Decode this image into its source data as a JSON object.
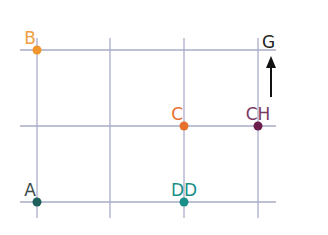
{
  "diagram": {
    "points": [
      {
        "label": "B",
        "col": 0,
        "row": 0,
        "color": "#f0962e"
      },
      {
        "label": "C",
        "col": 2,
        "row": 1,
        "color": "#e8702e"
      },
      {
        "label": "CH",
        "col": 3,
        "row": 1,
        "color": "#6b1d4e"
      },
      {
        "label": "A",
        "col": 0,
        "row": 2,
        "color": "#1f5f5b"
      },
      {
        "label": "DD",
        "col": 2,
        "row": 2,
        "color": "#1a8f8a"
      }
    ],
    "grid": {
      "columns": 4,
      "rows": 3,
      "line_color": "#a9adc9"
    },
    "compass": {
      "label": "G",
      "direction": "up"
    },
    "label_colors": {
      "B": "#f0a040",
      "C": "#e8702e",
      "CH": "#7a3a62",
      "A": "#3d4a4a",
      "DD": "#1a8f8a"
    }
  }
}
